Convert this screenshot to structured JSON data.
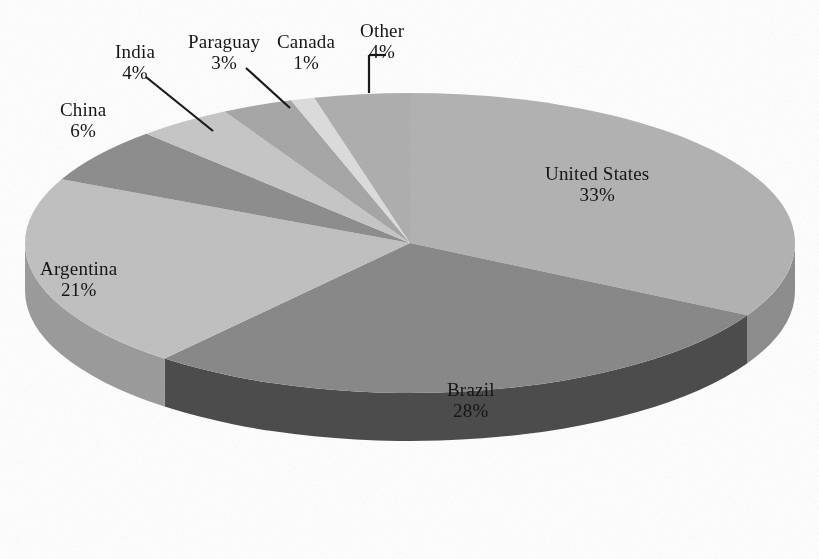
{
  "chart_data": {
    "type": "pie",
    "title": "",
    "subtitle": "",
    "xlabel": "",
    "ylabel": "",
    "legend_position": "none",
    "grid": false,
    "three_d": true,
    "units": "percent",
    "categories": [
      "United States",
      "Brazil",
      "Argentina",
      "China",
      "India",
      "Paraguay",
      "Canada",
      "Other"
    ],
    "values": [
      33,
      28,
      21,
      6,
      4,
      3,
      1,
      4
    ],
    "slices": [
      {
        "label": "United States",
        "value": 33,
        "percent_text": "33%",
        "color": "#b4b4b4",
        "side_color": "#8f8f8f",
        "label_x": 545,
        "label_y": 163,
        "label_inside": true,
        "leader": false
      },
      {
        "label": "Brazil",
        "value": 28,
        "percent_text": "28%",
        "color": "#8a8a8a",
        "side_color": "#4d4d4d",
        "label_x": 447,
        "label_y": 379,
        "label_inside": true,
        "leader": false
      },
      {
        "label": "Argentina",
        "value": 21,
        "percent_text": "21%",
        "color": "#c2c2c2",
        "side_color": "#9d9d9d",
        "label_x": 40,
        "label_y": 258,
        "label_inside": true,
        "leader": false
      },
      {
        "label": "China",
        "value": 6,
        "percent_text": "6%",
        "color": "#8f8f8f",
        "side_color": "#6e6e6e",
        "label_x": 60,
        "label_y": 99,
        "label_inside": false,
        "leader": false
      },
      {
        "label": "India",
        "value": 4,
        "percent_text": "4%",
        "color": "#c8c8c8",
        "side_color": "#a2a2a2",
        "label_x": 115,
        "label_y": 41,
        "label_inside": false,
        "leader": true
      },
      {
        "label": "Paraguay",
        "value": 3,
        "percent_text": "3%",
        "color": "#a8a8a8",
        "side_color": "#858585",
        "label_x": 188,
        "label_y": 31,
        "label_inside": false,
        "leader": true
      },
      {
        "label": "Canada",
        "value": 1,
        "percent_text": "1%",
        "color": "#dedede",
        "side_color": "#b5b5b5",
        "label_x": 277,
        "label_y": 31,
        "label_inside": false,
        "leader": true
      },
      {
        "label": "Other",
        "value": 4,
        "percent_text": "4%",
        "color": "#b0b0b0",
        "side_color": "#8d8d8d",
        "label_x": 360,
        "label_y": 20,
        "label_inside": false,
        "leader": true
      }
    ],
    "geometry": {
      "center_x": 410,
      "center_y": 243,
      "radius_x": 385,
      "radius_y": 150,
      "depth": 48,
      "start_angle_deg": -90,
      "direction": "clockwise"
    },
    "leader_lines": [
      {
        "name": "india-leader",
        "x1": 146,
        "y1": 77,
        "x2": 213,
        "y2": 131
      },
      {
        "name": "paraguay-leader",
        "x1": 246,
        "y1": 68,
        "x2": 290,
        "y2": 108
      },
      {
        "name": "canada-leader",
        "x1": 369,
        "y1": 55,
        "x2": 369,
        "y2": 93
      },
      {
        "name": "other-leader",
        "x1": 369,
        "y1": 55,
        "x2": 386,
        "y2": 55
      }
    ],
    "background_color": "#ffffff",
    "text_color": "#151515"
  }
}
